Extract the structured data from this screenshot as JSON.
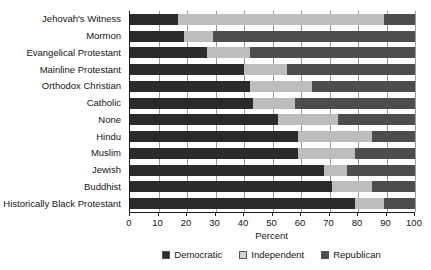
{
  "chart_data": {
    "type": "bar",
    "orientation": "horizontal",
    "stacked": true,
    "title": "",
    "xlabel": "Percent",
    "ylabel": "",
    "xlim": [
      0,
      100
    ],
    "xticks": [
      0,
      10,
      20,
      30,
      40,
      50,
      60,
      70,
      80,
      90,
      100
    ],
    "grid": true,
    "legend_position": "bottom-center",
    "categories": [
      "Jehovah's Witness",
      "Mormon",
      "Evangelical Protestant",
      "Mainline Protestant",
      "Orthodox Christian",
      "Catholic",
      "None",
      "Hindu",
      "Muslim",
      "Jewish",
      "Buddhist",
      "Historically Black Protestant"
    ],
    "series": [
      {
        "name": "Democratic",
        "color": "#2b2b2b",
        "values": [
          17,
          19,
          27,
          40,
          42,
          43,
          52,
          59,
          59,
          68,
          71,
          79
        ]
      },
      {
        "name": "Independent",
        "color": "#bdbdbd",
        "values": [
          72,
          10,
          15,
          15,
          22,
          15,
          21,
          26,
          20,
          8,
          14,
          10
        ]
      },
      {
        "name": "Republican",
        "color": "#4d4d4d",
        "values": [
          11,
          71,
          58,
          45,
          36,
          42,
          27,
          15,
          21,
          24,
          15,
          11
        ]
      }
    ]
  },
  "legend": {
    "items": [
      {
        "label": "Democratic"
      },
      {
        "label": "Independent"
      },
      {
        "label": "Republican"
      }
    ]
  }
}
